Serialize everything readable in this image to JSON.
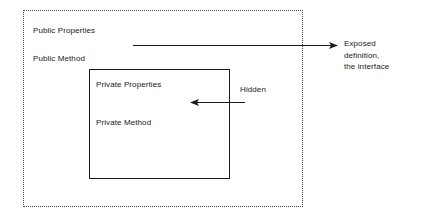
{
  "diagram": {
    "outer_boundary": {
      "name": "public-interface-boundary",
      "style": "dotted",
      "color": "#444444"
    },
    "inner_boundary": {
      "name": "private-implementation-boundary",
      "style": "solid",
      "color": "#1a1a1a"
    },
    "labels": {
      "public_properties": "Public Properties",
      "public_method": "Public Method",
      "private_properties": "Private Properties",
      "private_method": "Private Method",
      "hidden": "Hidden"
    },
    "annotation_exposed": {
      "line1": "Exposed",
      "line2": "definition,",
      "line3": "the interface"
    },
    "arrows": [
      {
        "name": "exposed-arrow",
        "direction": "right",
        "from": "public-interface-boundary",
        "to": "Exposed definition, the interface"
      },
      {
        "name": "hidden-arrow",
        "direction": "left",
        "from": "Hidden",
        "to": "private-implementation-boundary"
      }
    ],
    "colors": {
      "background": "#ffffff",
      "ink": "#1a1a1a",
      "dotted": "#444444"
    }
  }
}
